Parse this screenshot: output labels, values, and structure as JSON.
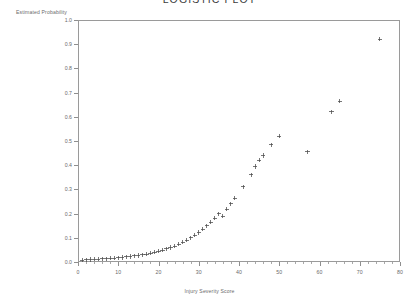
{
  "chart_data": {
    "type": "scatter",
    "title": "LOGISTIC PLOT",
    "xlabel": "Injury Severity Score",
    "ylabel": "Estimated Probability",
    "xlim": [
      0,
      80
    ],
    "ylim": [
      0.0,
      1.0
    ],
    "xticks": [
      0,
      10,
      20,
      30,
      40,
      50,
      60,
      70,
      80
    ],
    "xtick_labels": [
      "0",
      "10",
      "20",
      "30",
      "40",
      "50",
      "60",
      "70",
      "80"
    ],
    "x_minor_tick_step": 2,
    "yticks": [
      0.0,
      0.1,
      0.2,
      0.3,
      0.4,
      0.5,
      0.6,
      0.7,
      0.8,
      0.9,
      1.0
    ],
    "ytick_labels": [
      "0.0",
      "0.1",
      "0.2",
      "0.3",
      "0.4",
      "0.5",
      "0.6",
      "0.7",
      "0.8",
      "0.9",
      "1.0"
    ],
    "grid": false,
    "legend": null,
    "marker": "plus",
    "marker_color": "#4a4a4a",
    "frame_color": "#9a9a9a",
    "background": "#ffffff",
    "series": [
      {
        "name": "Estimated Probability",
        "points": [
          [
            1,
            0.008
          ],
          [
            2,
            0.009
          ],
          [
            3,
            0.01
          ],
          [
            4,
            0.011
          ],
          [
            5,
            0.012
          ],
          [
            6,
            0.013
          ],
          [
            7,
            0.014
          ],
          [
            8,
            0.015
          ],
          [
            9,
            0.016
          ],
          [
            10,
            0.017
          ],
          [
            11,
            0.019
          ],
          [
            12,
            0.021
          ],
          [
            13,
            0.023
          ],
          [
            14,
            0.025
          ],
          [
            15,
            0.027
          ],
          [
            16,
            0.03
          ],
          [
            17,
            0.033
          ],
          [
            18,
            0.036
          ],
          [
            19,
            0.04
          ],
          [
            20,
            0.044
          ],
          [
            21,
            0.049
          ],
          [
            22,
            0.054
          ],
          [
            23,
            0.06
          ],
          [
            24,
            0.066
          ],
          [
            25,
            0.073
          ],
          [
            26,
            0.081
          ],
          [
            27,
            0.09
          ],
          [
            28,
            0.1
          ],
          [
            29,
            0.11
          ],
          [
            30,
            0.122
          ],
          [
            31,
            0.135
          ],
          [
            32,
            0.149
          ],
          [
            33,
            0.164
          ],
          [
            34,
            0.181
          ],
          [
            35,
            0.199
          ],
          [
            36,
            0.19
          ],
          [
            37,
            0.218
          ],
          [
            38,
            0.24
          ],
          [
            39,
            0.263
          ],
          [
            41,
            0.31
          ],
          [
            43,
            0.36
          ],
          [
            44,
            0.395
          ],
          [
            45,
            0.42
          ],
          [
            46,
            0.44
          ],
          [
            48,
            0.485
          ],
          [
            50,
            0.52
          ],
          [
            57,
            0.455
          ],
          [
            63,
            0.62
          ],
          [
            65,
            0.665
          ],
          [
            75,
            0.92
          ]
        ]
      }
    ]
  }
}
